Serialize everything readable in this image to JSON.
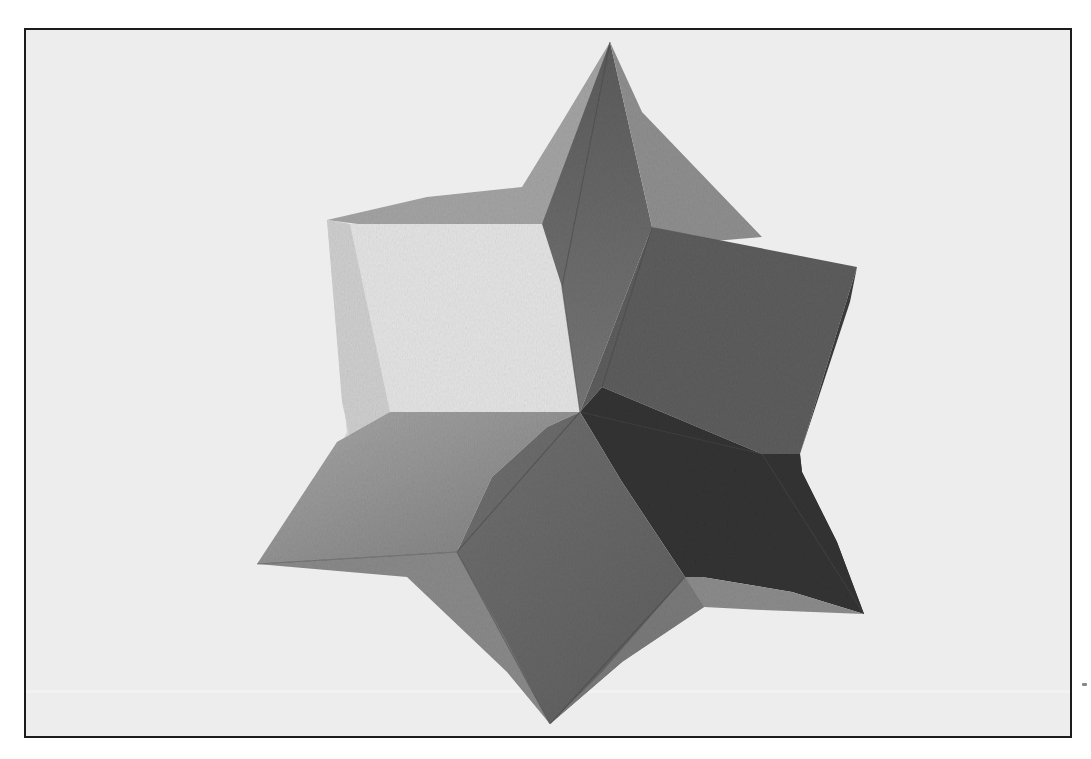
{
  "image": {
    "description": "Black-and-white photograph of a painted paper six-pointed star polyhedron (stellated form) on a light background, framed by a thin black border",
    "subject": "six-pointed star polyhedron",
    "style": "grayscale photograph"
  },
  "colors": {
    "background": "#ededed",
    "frame_border": "#1c1c1c",
    "face_lightest": "#e6e6e6",
    "face_light": "#cfcfcf",
    "face_mid_light": "#a9a9a9",
    "face_mid": "#8a8a8a",
    "face_mid_dark": "#6e6e6e",
    "face_dark": "#5a5a5a",
    "face_darkest": "#3a3a3a"
  }
}
